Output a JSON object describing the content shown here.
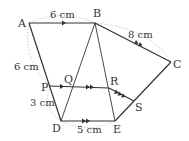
{
  "diagram": {
    "points": {
      "A": {
        "label": "A",
        "x": 29,
        "y": 23
      },
      "B": {
        "label": "B",
        "x": 95,
        "y": 23
      },
      "C": {
        "label": "C",
        "x": 171,
        "y": 62
      },
      "D": {
        "label": "D",
        "x": 61,
        "y": 121
      },
      "E": {
        "label": "E",
        "x": 115,
        "y": 121
      },
      "P": {
        "label": "P",
        "x": 50,
        "y": 86
      },
      "Q": {
        "label": "Q",
        "x": 70,
        "y": 87
      },
      "R": {
        "label": "R",
        "x": 109,
        "y": 88
      },
      "S": {
        "label": "S",
        "x": 134,
        "y": 101
      }
    },
    "measurements": {
      "AB": "6 cm",
      "BC": "8 cm",
      "AP": "6 cm",
      "PD": "3 cm",
      "DE": "5 cm"
    },
    "colors": {
      "line": "#333333",
      "dotted": "#aaaaaa"
    }
  }
}
